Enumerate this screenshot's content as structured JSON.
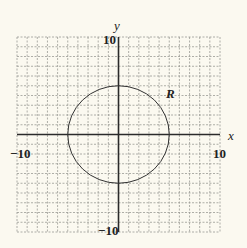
{
  "chart_data": {
    "type": "line",
    "title": "",
    "xlabel": "x",
    "ylabel": "y",
    "xlim": [
      -10,
      10
    ],
    "ylim": [
      -10,
      10
    ],
    "grid": true,
    "grid_step": 1,
    "tick_labels": {
      "x_min": "−10",
      "x_max": "10",
      "y_min": "−10",
      "y_max": "10"
    },
    "shapes": [
      {
        "kind": "circle",
        "center": [
          0,
          0
        ],
        "radius": 5,
        "label": "R"
      }
    ],
    "annotations": [
      {
        "text": "R",
        "x": 6.5,
        "y": 5
      }
    ]
  },
  "colors": {
    "background": "#fbf9f0",
    "grid": "#9a9a94",
    "axis": "#2a2a2a",
    "curve": "#333333"
  }
}
